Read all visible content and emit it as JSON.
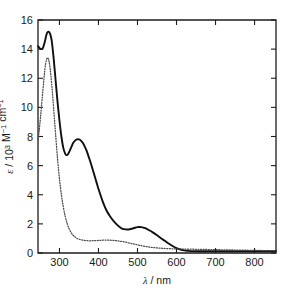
{
  "chart_data": {
    "type": "line",
    "title": "",
    "xlabel": "λ / nm",
    "ylabel": "ε / 10³ M⁻¹ cm⁻¹",
    "ylabel_parts": {
      "symbol": "ε",
      "separator": " / 10",
      "exponent": "3",
      "unit_m": " M",
      "unit_m_exp": "−1",
      "unit_cm": " cm",
      "unit_cm_exp": "−1"
    },
    "xlabel_parts": {
      "symbol": "λ",
      "unit": " / nm"
    },
    "xlim": [
      245,
      855
    ],
    "ylim": [
      0,
      16
    ],
    "xticks": [
      300,
      400,
      500,
      600,
      700,
      800
    ],
    "yticks": [
      0,
      2,
      4,
      6,
      8,
      10,
      12,
      14,
      16
    ],
    "xtick_labels": [
      "300",
      "400",
      "500",
      "600",
      "700",
      "800"
    ],
    "ytick_labels": [
      "0",
      "2",
      "4",
      "6",
      "8",
      "10",
      "12",
      "14",
      "16"
    ],
    "grid": false,
    "legend": null,
    "series": [
      {
        "name": "solid-spectrum",
        "style": "solid",
        "color": "#101010",
        "x": [
          245,
          250,
          255,
          258,
          262,
          265,
          268,
          272,
          276,
          280,
          285,
          290,
          295,
          300,
          305,
          310,
          315,
          318,
          322,
          326,
          330,
          335,
          340,
          345,
          350,
          355,
          360,
          365,
          370,
          375,
          380,
          385,
          390,
          395,
          400,
          410,
          420,
          430,
          440,
          450,
          460,
          470,
          480,
          490,
          500,
          510,
          520,
          530,
          540,
          550,
          560,
          570,
          580,
          590,
          600,
          610,
          620,
          630,
          640,
          660,
          680,
          700,
          720,
          740,
          760,
          780,
          800,
          820,
          840,
          855
        ],
        "y": [
          14.2,
          14.05,
          14.0,
          14.1,
          14.45,
          14.8,
          15.1,
          15.2,
          15.05,
          14.6,
          13.4,
          11.9,
          10.4,
          9.1,
          8.0,
          7.2,
          6.8,
          6.72,
          6.78,
          7.0,
          7.25,
          7.55,
          7.72,
          7.8,
          7.8,
          7.72,
          7.55,
          7.3,
          7.0,
          6.6,
          6.2,
          5.75,
          5.3,
          4.85,
          4.4,
          3.6,
          2.95,
          2.5,
          2.15,
          1.88,
          1.68,
          1.62,
          1.63,
          1.7,
          1.78,
          1.78,
          1.7,
          1.56,
          1.4,
          1.22,
          1.02,
          0.84,
          0.65,
          0.48,
          0.34,
          0.24,
          0.18,
          0.15,
          0.13,
          0.12,
          0.12,
          0.12,
          0.12,
          0.12,
          0.12,
          0.12,
          0.12,
          0.12,
          0.12,
          0.12
        ]
      },
      {
        "name": "dotted-spectrum",
        "style": "dotted",
        "color": "#4a4a4a",
        "x": [
          245,
          248,
          252,
          256,
          260,
          263,
          266,
          269,
          272,
          275,
          278,
          282,
          286,
          290,
          295,
          300,
          305,
          310,
          315,
          320,
          325,
          330,
          335,
          340,
          345,
          350,
          360,
          370,
          380,
          390,
          400,
          410,
          420,
          430,
          440,
          450,
          460,
          470,
          480,
          490,
          500,
          510,
          520,
          530,
          540,
          550,
          560,
          570,
          580,
          590,
          600,
          620,
          640,
          660,
          680,
          700,
          720,
          740,
          760,
          780,
          800,
          820,
          840,
          855
        ],
        "y": [
          7.8,
          8.4,
          9.5,
          10.7,
          11.9,
          12.7,
          13.2,
          13.4,
          13.3,
          12.9,
          12.2,
          11.0,
          9.6,
          8.2,
          6.5,
          5.1,
          4.0,
          3.15,
          2.5,
          2.0,
          1.65,
          1.4,
          1.22,
          1.1,
          1.0,
          0.95,
          0.88,
          0.85,
          0.84,
          0.85,
          0.86,
          0.88,
          0.89,
          0.88,
          0.86,
          0.83,
          0.79,
          0.74,
          0.68,
          0.62,
          0.56,
          0.5,
          0.45,
          0.41,
          0.38,
          0.35,
          0.33,
          0.31,
          0.3,
          0.29,
          0.28,
          0.27,
          0.26,
          0.25,
          0.24,
          0.23,
          0.22,
          0.21,
          0.2,
          0.19,
          0.18,
          0.17,
          0.16,
          0.15
        ]
      }
    ],
    "annotations": []
  }
}
